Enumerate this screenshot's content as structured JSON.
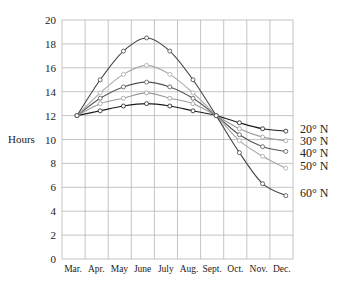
{
  "chart_data": {
    "type": "line",
    "title": "",
    "xlabel": "",
    "ylabel": "Hours",
    "ylim": [
      0,
      20
    ],
    "yticks": [
      0,
      2,
      4,
      6,
      8,
      10,
      12,
      14,
      16,
      18,
      20
    ],
    "grid": true,
    "legend_position": "right, inline labels",
    "categories": [
      "Mar.",
      "Apr.",
      "May",
      "June",
      "July",
      "Aug.",
      "Sept.",
      "Oct.",
      "Nov.",
      "Dec."
    ],
    "series": [
      {
        "name": "20° N",
        "color": "#1a1a1a",
        "values": [
          12,
          12.4,
          12.8,
          13.0,
          12.8,
          12.4,
          12,
          11.4,
          10.9,
          10.7
        ]
      },
      {
        "name": "30° N",
        "color": "#9a9a9a",
        "values": [
          12,
          13.0,
          13.45,
          13.9,
          13.45,
          13.0,
          12,
          10.9,
          10.2,
          9.9
        ]
      },
      {
        "name": "40° N",
        "color": "#555555",
        "values": [
          12,
          13.45,
          14.4,
          14.8,
          14.4,
          13.45,
          12,
          10.4,
          9.4,
          9.0
        ]
      },
      {
        "name": "50° N",
        "color": "#a8a8a8",
        "values": [
          12,
          13.9,
          15.45,
          16.2,
          15.45,
          13.9,
          12,
          9.9,
          8.6,
          7.6
        ]
      },
      {
        "name": "60° N",
        "color": "#444444",
        "values": [
          12,
          15.0,
          17.4,
          18.5,
          17.4,
          15.0,
          12,
          8.9,
          6.3,
          5.3
        ]
      }
    ]
  },
  "labels": {
    "ylabel": "Hours"
  }
}
